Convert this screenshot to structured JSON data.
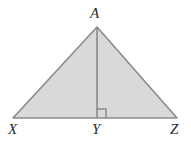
{
  "figure": {
    "kind": "geometry-diagram",
    "background_color": "#ffffff",
    "fill_color": "#d9d9d9",
    "stroke_color": "#8a8a8a",
    "label_color": "#2b2b2b",
    "stroke_width": 1.6,
    "labels": {
      "apex": "A",
      "base_left": "X",
      "base_mid": "Y",
      "base_right": "Z"
    },
    "points": {
      "A": {
        "x": 97,
        "y": 27
      },
      "X": {
        "x": 13,
        "y": 118
      },
      "Y": {
        "x": 97,
        "y": 118
      },
      "Z": {
        "x": 177,
        "y": 118
      }
    },
    "right_angle_marker": {
      "at": "Y",
      "size": 9,
      "opens": "right",
      "shown": true
    },
    "altitude": {
      "from": "A",
      "to": "Y",
      "perpendicular": true
    }
  }
}
